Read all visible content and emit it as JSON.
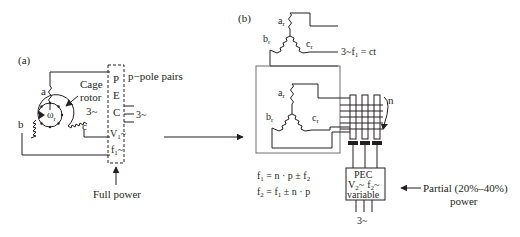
{
  "figure": {
    "panel_a": {
      "label": "(a)",
      "windings": {
        "a": "a",
        "b": "b",
        "c": "c"
      },
      "rotor": {
        "line1": "Cage",
        "line2": "rotor",
        "line3": "3~",
        "speed_symbol": "ω",
        "speed_sub": "r"
      },
      "converter": {
        "letters": [
          "P",
          "E",
          "C"
        ],
        "v1": "V",
        "v1_sub": "1",
        "v1_suffix": "~",
        "f1": "f",
        "f1_sub": "1",
        "f1_suffix": "~"
      },
      "pole_pairs": "p−pole pairs",
      "grid": "3~",
      "power_note": "Full power"
    },
    "panel_b": {
      "label": "(b)",
      "top_windings": {
        "a": "a",
        "b": "b",
        "c": "c",
        "sub": "r"
      },
      "grid_label": "3~f",
      "grid_label_sub": "1",
      "grid_label_suffix": " = ct",
      "rotor_windings": {
        "a": "a",
        "b": "b",
        "c": "c",
        "sub": "r"
      },
      "speed": "n",
      "eq1": {
        "lhs": "f",
        "lhs_sub": "1",
        "rhs": " = n · p ± f",
        "rhs_sub": "2"
      },
      "eq2": {
        "lhs": "f",
        "lhs_sub": "2",
        "rhs": " = f",
        "rhs_sub": "1",
        "rhs_tail": " ± n · p"
      },
      "converter": {
        "line1": "PEC",
        "v2": "V",
        "v2_sub": "2",
        "v2_suffix": "~",
        "f2": "f",
        "f2_sub": "2",
        "f2_suffix": "~",
        "line3": "variable"
      },
      "grid": "3~",
      "power_note_line1": "Partial (20%–40%)",
      "power_note_line2": "power"
    }
  }
}
